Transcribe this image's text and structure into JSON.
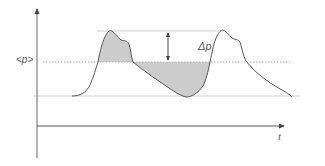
{
  "diagram": {
    "type": "pressure-fluctuation-sketch",
    "y_axis_label": "",
    "x_axis_label": "t",
    "mean_label": "<p>",
    "delta_label": "Δp",
    "colors": {
      "axis": "#555555",
      "curve": "#555555",
      "fill": "#cccccc",
      "dotted_line": "#b0b0b0",
      "guide_line": "#cfcfcf",
      "text": "#555555"
    },
    "curve_description": "Periodic signal with two peaks above the mean level <p>; areas above and below the mean are shaded grey; double-headed arrow marks amplitude Δp between peak and mean."
  }
}
